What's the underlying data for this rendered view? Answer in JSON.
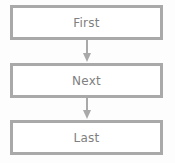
{
  "diagram": {
    "type": "vertical-flowchart",
    "background_color": "#fdfdfd",
    "border_color": "#a9a9a9",
    "text_color": "#808080",
    "fill_color": "#ffffff",
    "nodes": [
      {
        "id": "first",
        "label": "First"
      },
      {
        "id": "next",
        "label": "Next"
      },
      {
        "id": "last",
        "label": "Last"
      }
    ],
    "connectors": [
      {
        "id": "arrow-first-next",
        "icon": "arrow-down-icon",
        "from": "first",
        "to": "next"
      },
      {
        "id": "arrow-next-last",
        "icon": "arrow-down-icon",
        "from": "next",
        "to": "last"
      }
    ]
  }
}
